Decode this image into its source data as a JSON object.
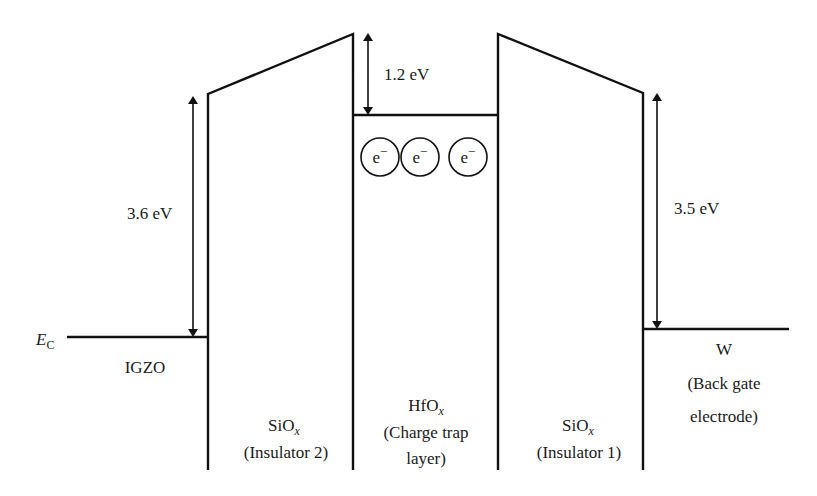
{
  "diagram": {
    "type": "energy band diagram",
    "colors": {
      "line": "#111111",
      "text": "#1a1a1a",
      "background": "#ffffff"
    },
    "ec_label": {
      "main": "E",
      "sub": "C"
    },
    "regions": [
      {
        "id": "igzo",
        "name": "IGZO",
        "line1": "IGZO"
      },
      {
        "id": "sio-insulator2",
        "name": "SiOx",
        "formula_main": "SiO",
        "formula_sub": "x",
        "line2": "(Insulator 2)"
      },
      {
        "id": "hfox-trap",
        "name": "HfOx",
        "formula_main": "HfO",
        "formula_sub": "x",
        "line2": "(Charge trap",
        "line3": "layer)"
      },
      {
        "id": "sio-insulator1",
        "name": "SiOx",
        "formula_main": "SiO",
        "formula_sub": "x",
        "line2": "(Insulator 1)"
      },
      {
        "id": "w-gate",
        "name": "W",
        "line1": "W",
        "line2": "(Back gate",
        "line3": "electrode)"
      }
    ],
    "energy_gaps": [
      {
        "label": "3.6 eV",
        "between": "IGZO Ec and Insulator 2 barrier top"
      },
      {
        "label": "1.2 eV",
        "between": "Barrier peak and HfOx trap level"
      },
      {
        "label": "3.5 eV",
        "between": "Insulator 1 barrier edge and W Fermi level"
      }
    ],
    "electrons": [
      {
        "main": "e",
        "sup": "−"
      },
      {
        "main": "e",
        "sup": "−"
      },
      {
        "main": "e",
        "sup": "−"
      }
    ]
  }
}
